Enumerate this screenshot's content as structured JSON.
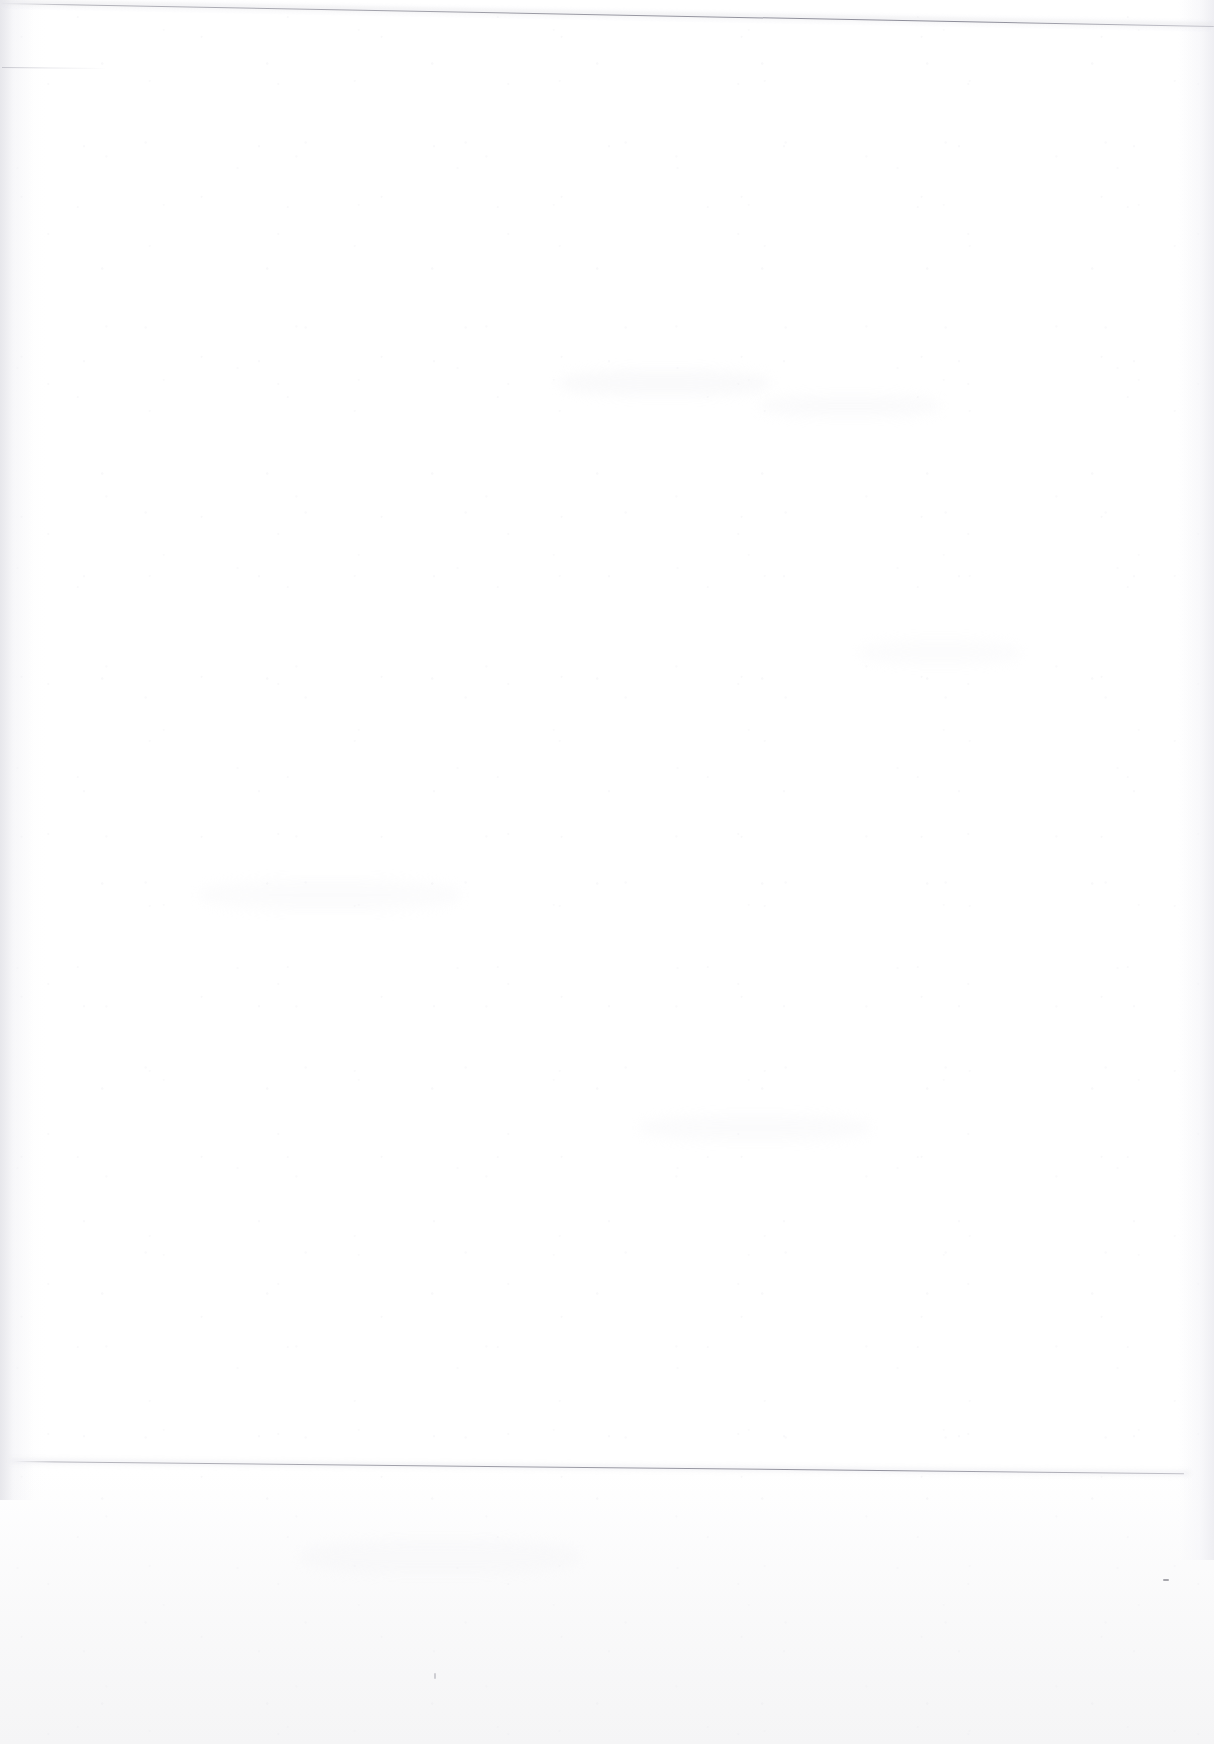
{
  "document": {
    "kind": "scanned-page",
    "content_state": "blank",
    "description": "Blank scanned page with no printed text, figures or tables",
    "page_text": "",
    "visible_text_blocks": [],
    "background_color": "#ffffff",
    "paper_tone": "#fdfdfe",
    "backing_tone": "#f5f5f6"
  },
  "artifacts": {
    "top_edge": {
      "name": "page-top-edge",
      "color": "#8e8e99",
      "start_y": 3,
      "end_y": 25,
      "skew_degrees": 1.08
    },
    "left_margin_stub": {
      "name": "left-margin-stub",
      "color": "#c4c4cb",
      "y": 67,
      "length": 104
    },
    "bottom_edge": {
      "name": "page-bottom-edge",
      "color": "#92929d",
      "start_x": 14,
      "start_y": 1461,
      "end_x": 1184,
      "end_y": 1485,
      "skew_degrees": 0.6
    },
    "gutter_shadow": {
      "name": "left-gutter-shadow",
      "color": "#e4e4e9",
      "width": 34
    },
    "right_shadow": {
      "name": "right-edge-shadow",
      "color": "#ebebf0",
      "width": 36
    },
    "specks": [
      {
        "name": "speck-lower-right",
        "x": 1163,
        "y": 1579
      },
      {
        "name": "speck-bottom-center",
        "x": 434,
        "y": 1673
      }
    ],
    "showthrough_note": "Faint ghosting from the reverse side of the sheet; no legible characters"
  }
}
